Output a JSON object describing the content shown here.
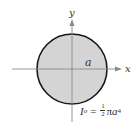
{
  "diagram": {
    "axes": {
      "x_label": "x",
      "y_label": "y"
    },
    "shape": {
      "type": "circle",
      "radius_label": "a",
      "fill_color": "#d4d4d4",
      "stroke_color": "#1a1a1a"
    },
    "formula": {
      "lhs_symbol": "I",
      "lhs_subscript": "o",
      "equals": "=",
      "frac_numerator": "1",
      "frac_denominator": "2",
      "pi": "π",
      "variable": "a",
      "exponent": "4",
      "full_text": "I_o = (1/2) π a^4"
    },
    "colors": {
      "axis": "#8a8a8a",
      "text": "#333333",
      "background": "#ffffff"
    }
  }
}
